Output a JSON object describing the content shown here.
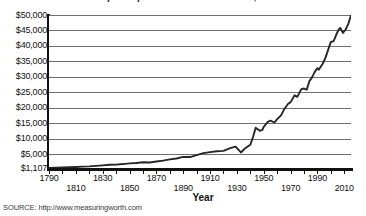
{
  "title": "Real GDP per capita in the United States, 1790-2015",
  "axis": {
    "x_title": "Year",
    "y_ticks": [
      "$50,000",
      "$45,000",
      "$40,000",
      "$35,000",
      "$30,000",
      "$25,000",
      "$20,000",
      "$15,000",
      "$10,000",
      "$5,000",
      "$1,107"
    ],
    "x_ticks_row_a": [
      "1790",
      "1830",
      "1870",
      "1910",
      "1950",
      "1990"
    ],
    "x_ticks_row_b": [
      "1810",
      "1850",
      "1890",
      "1930",
      "1970",
      "2010"
    ]
  },
  "source": "SOURCE: http://www.measuringworth.com",
  "colors": {
    "line": "#262626",
    "grid": "#6f6f6f",
    "axis": "#111111",
    "background": "#ffffff"
  },
  "chart_data": {
    "type": "line",
    "title": "Real GDP per capita in the United States, 1790-2015",
    "xlabel": "Year",
    "ylabel": "",
    "xlim": [
      1790,
      2015
    ],
    "ylim": [
      1107,
      50000
    ],
    "grid": true,
    "legend": "none",
    "ytick_values": [
      50000,
      45000,
      40000,
      35000,
      30000,
      25000,
      20000,
      15000,
      10000,
      5000,
      1107
    ],
    "ytick_labels": [
      "$50,000",
      "$45,000",
      "$40,000",
      "$35,000",
      "$30,000",
      "$25,000",
      "$20,000",
      "$15,000",
      "$10,000",
      "$5,000",
      "$1,107"
    ],
    "xtick_values": [
      1790,
      1800,
      1810,
      1820,
      1830,
      1840,
      1850,
      1860,
      1870,
      1880,
      1890,
      1900,
      1910,
      1920,
      1930,
      1940,
      1950,
      1960,
      1970,
      1980,
      1990,
      2000,
      2010
    ],
    "xtick_labels_shown": [
      "1790",
      "1810",
      "1830",
      "1850",
      "1870",
      "1890",
      "1910",
      "1930",
      "1950",
      "1970",
      "1990",
      "2010"
    ],
    "series": [
      {
        "name": "Real GDP per capita",
        "x": [
          1790,
          1795,
          1800,
          1805,
          1810,
          1815,
          1820,
          1825,
          1830,
          1835,
          1840,
          1845,
          1850,
          1855,
          1860,
          1865,
          1870,
          1875,
          1880,
          1885,
          1890,
          1895,
          1900,
          1905,
          1910,
          1915,
          1920,
          1925,
          1929,
          1933,
          1936,
          1940,
          1942,
          1944,
          1945,
          1947,
          1949,
          1950,
          1953,
          1955,
          1958,
          1960,
          1963,
          1965,
          1968,
          1970,
          1973,
          1975,
          1978,
          1980,
          1982,
          1984,
          1986,
          1988,
          1990,
          1991,
          1994,
          1996,
          1998,
          2000,
          2002,
          2004,
          2006,
          2007,
          2009,
          2011,
          2013,
          2015
        ],
        "y": [
          1107,
          1180,
          1250,
          1320,
          1400,
          1480,
          1560,
          1700,
          1850,
          2000,
          2050,
          2200,
          2400,
          2500,
          2700,
          2650,
          2900,
          3150,
          3500,
          3750,
          4200,
          4150,
          4700,
          5300,
          5600,
          5900,
          6000,
          6900,
          7400,
          5500,
          6800,
          8000,
          10500,
          13500,
          13200,
          12500,
          12800,
          13800,
          15400,
          15800,
          15200,
          16300,
          17600,
          19300,
          21200,
          21800,
          24000,
          23500,
          26000,
          26200,
          25800,
          28600,
          29800,
          31600,
          32800,
          32300,
          34300,
          36200,
          38800,
          41300,
          41500,
          43600,
          45400,
          45800,
          44200,
          45300,
          47100,
          50000
        ]
      }
    ],
    "annotations": [
      {
        "text": "$1,107",
        "note": "baseline / starting value in 1790"
      },
      {
        "text": "Great Depression trough",
        "approx_year": 1933
      },
      {
        "text": "WWII production peak",
        "approx_year": 1944
      }
    ]
  }
}
